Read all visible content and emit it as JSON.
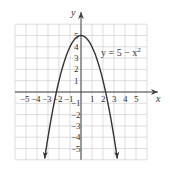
{
  "chart_data": {
    "type": "line",
    "title": "",
    "equation_label": "y = 5 − x²",
    "equation_base": "y = 5 − x",
    "equation_exp": "2",
    "xlabel": "x",
    "ylabel": "y",
    "xlim": [
      -6,
      6
    ],
    "ylim": [
      -6,
      6
    ],
    "grid": true,
    "x_tick_labels": [
      "−5",
      "−4",
      "−3",
      "−2",
      "−1",
      "1",
      "2",
      "3",
      "4",
      "5"
    ],
    "y_tick_labels": [
      "5",
      "4",
      "3",
      "2",
      "1",
      "−1",
      "−2",
      "−3",
      "−4",
      "−5"
    ],
    "series": [
      {
        "name": "y = 5 − x²",
        "x": [
          -3.3,
          -3,
          -2.5,
          -2,
          -1.5,
          -1,
          -0.5,
          0,
          0.5,
          1,
          1.5,
          2,
          2.5,
          3,
          3.3
        ],
        "y": [
          -5.89,
          -4,
          -1.25,
          1,
          2.75,
          4,
          4.75,
          5,
          4.75,
          4,
          2.75,
          1,
          -1.25,
          -4,
          -5.89
        ],
        "arrows_at_ends": true
      }
    ],
    "colors": {
      "curve": "#333333",
      "axis": "#444444",
      "grid": "#cccccc"
    }
  }
}
